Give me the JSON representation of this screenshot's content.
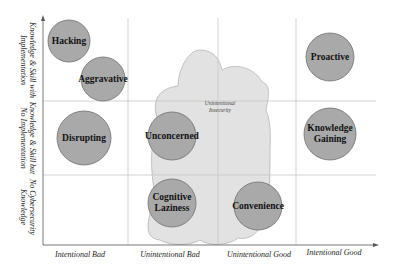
{
  "diagram": {
    "x_axis_labels": [
      "Intentional Bad",
      "Unintentional Bad",
      "Unintentional Good",
      "Intentional Good"
    ],
    "y_axis_labels": [
      {
        "line1": "Knowledge & Skill with",
        "line2": "Implementation"
      },
      {
        "line1": "Knowledge & Skill but",
        "line2": "No Implementation"
      },
      {
        "line1": "No Cybersecurity",
        "line2": "Knowledge"
      }
    ],
    "cloud": {
      "line1": "Unintentional",
      "line2": "Insecurity"
    },
    "circles": [
      {
        "id": "hacking",
        "line1": "Hacking",
        "line2": ""
      },
      {
        "id": "aggravative",
        "line1": "Aggravative",
        "line2": ""
      },
      {
        "id": "disrupting",
        "line1": "Disrupting",
        "line2": ""
      },
      {
        "id": "unconcerned",
        "line1": "Unconcerned",
        "line2": ""
      },
      {
        "id": "cognitive-laziness",
        "line1": "Cognitive",
        "line2": "Laziness"
      },
      {
        "id": "convenience",
        "line1": "Convenience",
        "line2": ""
      },
      {
        "id": "proactive",
        "line1": "Proactive",
        "line2": ""
      },
      {
        "id": "knowledge-gaining",
        "line1": "Knowledge",
        "line2": "Gaining"
      }
    ],
    "colors": {
      "circle_fill": "#a9a9a9",
      "circle_stroke": "#6e6e6e",
      "cloud_fill": "#e2e2e2",
      "cloud_stroke": "#b5b5b5",
      "grid": "#c8c8c8",
      "axis": "#555555"
    }
  }
}
